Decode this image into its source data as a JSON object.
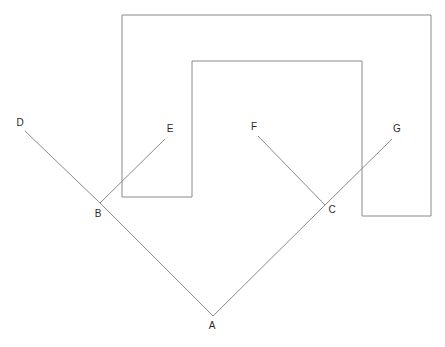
{
  "figure": {
    "canvas": {
      "width": 445,
      "height": 347,
      "background": "#ffffff"
    },
    "stroke": {
      "color": "#8a8a8a",
      "width": 1
    },
    "label_color": "#2b2b2b",
    "label_font_size": 10,
    "points": {
      "A": {
        "label": "A",
        "x": 213,
        "y": 316,
        "label_x": 212,
        "label_y": 329
      },
      "B": {
        "label": "B",
        "x": 100,
        "y": 203,
        "label_x": 98,
        "label_y": 217
      },
      "C": {
        "label": "C",
        "x": 325,
        "y": 205,
        "label_x": 332,
        "label_y": 213
      },
      "D": {
        "label": "D",
        "x": 25,
        "y": 131,
        "label_x": 20,
        "label_y": 126
      },
      "E": {
        "label": "E",
        "x": 165,
        "y": 139,
        "label_x": 170,
        "label_y": 132
      },
      "F": {
        "label": "F",
        "x": 258,
        "y": 136,
        "label_x": 254,
        "label_y": 130
      },
      "G": {
        "label": "G",
        "x": 392,
        "y": 139,
        "label_x": 397,
        "label_y": 132
      }
    },
    "segments": [
      {
        "name": "segment-d-b",
        "from": "D",
        "to": "B",
        "x1": 25,
        "y1": 131,
        "x2": 100,
        "y2": 203
      },
      {
        "name": "segment-b-a",
        "from": "B",
        "to": "A",
        "x1": 100,
        "y1": 203,
        "x2": 213,
        "y2": 316
      },
      {
        "name": "segment-a-c",
        "from": "A",
        "to": "C",
        "x1": 213,
        "y1": 316,
        "x2": 325,
        "y2": 205
      },
      {
        "name": "segment-c-g",
        "from": "C",
        "to": "G",
        "x1": 325,
        "y1": 205,
        "x2": 392,
        "y2": 139
      },
      {
        "name": "segment-b-e",
        "from": "B",
        "to": "E",
        "x1": 100,
        "y1": 203,
        "x2": 165,
        "y2": 139
      },
      {
        "name": "segment-f-c",
        "from": "F",
        "to": "C",
        "x1": 258,
        "y1": 136,
        "x2": 325,
        "y2": 205
      }
    ],
    "polygon": {
      "name": "bracket-outline",
      "description": "Downward-open bracket shaped outline formed by two nested rectangles",
      "points": "122,15 431,15 431,216 362,216 362,61 192,61 192,197 122,197"
    }
  }
}
